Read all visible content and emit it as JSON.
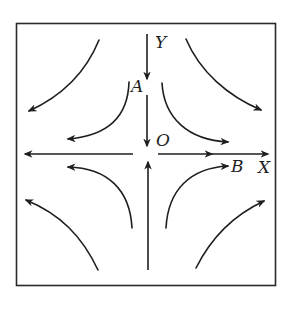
{
  "diagram": {
    "type": "phase-portrait-saddle",
    "labels": {
      "y_axis": "Y",
      "x_axis": "X",
      "point_a": "A",
      "origin": "O",
      "point_b": "B"
    },
    "colors": {
      "stroke": "#1e1e1e",
      "frame": "#2a2a2a",
      "background": "#ffffff"
    },
    "axes": {
      "y_direction": "toward origin (downward from top, upward from bottom)",
      "x_direction": "away from origin (leftward on left, rightward on right)"
    },
    "flow_lines": [
      {
        "quadrant": "upper-left",
        "ring": "outer",
        "direction": "down-left"
      },
      {
        "quadrant": "upper-left",
        "ring": "inner",
        "direction": "down-left"
      },
      {
        "quadrant": "upper-right",
        "ring": "inner",
        "direction": "down-right"
      },
      {
        "quadrant": "upper-right",
        "ring": "outer",
        "direction": "down-right"
      },
      {
        "quadrant": "lower-left",
        "ring": "outer",
        "direction": "up-left"
      },
      {
        "quadrant": "lower-left",
        "ring": "inner",
        "direction": "up-left"
      },
      {
        "quadrant": "lower-right",
        "ring": "inner",
        "direction": "up-right"
      },
      {
        "quadrant": "lower-right",
        "ring": "outer",
        "direction": "up-right"
      }
    ]
  }
}
